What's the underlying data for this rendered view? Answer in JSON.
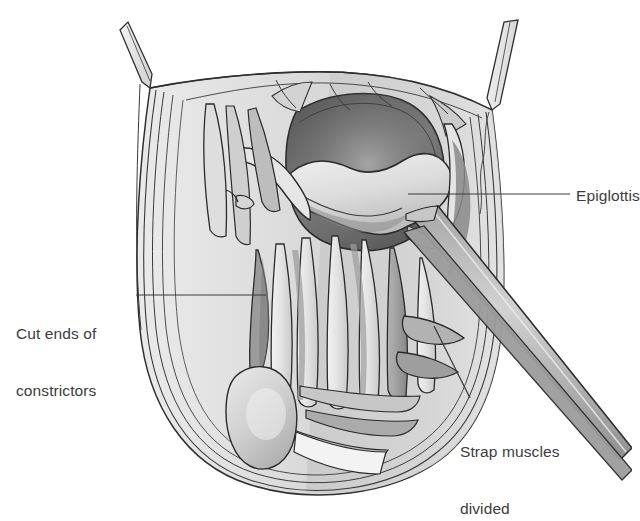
{
  "figure": {
    "kind": "medical-line-illustration",
    "background_color": "#ffffff",
    "ink_color": "#2b2b2b",
    "label_color": "#3c3c3c",
    "leader_color": "#3a3a3a"
  },
  "labels": [
    {
      "id": "epiglottis",
      "text": "Epiglottis",
      "lines": [
        "Epiglottis"
      ],
      "leader": {
        "from_x": 408,
        "from_y": 194,
        "to_x": 570,
        "to_y": 194,
        "style": "horizontal"
      }
    },
    {
      "id": "constrictors",
      "text": "Cut ends of constrictors",
      "lines": [
        "Cut ends of",
        "constrictors"
      ],
      "leader": {
        "from_x": 136,
        "from_y": 295,
        "to_x": 266,
        "to_y": 295,
        "style": "horizontal"
      }
    },
    {
      "id": "strap-muscles",
      "text": "Strap muscles divided",
      "lines": [
        "Strap muscles",
        "divided"
      ],
      "leader": {
        "from_x": 470,
        "from_y": 398,
        "to_x": 434,
        "to_y": 326,
        "style": "diagonal"
      }
    }
  ],
  "anatomy": {
    "specimen_outline": "U-shaped pharyngeal specimen opened anteriorly",
    "structures": [
      {
        "name": "pharyngeal-lumen",
        "tone": "#6e6e6e",
        "note": "dark oval opening at upper centre"
      },
      {
        "name": "epiglottis-flap",
        "tone": "#d8d8d8",
        "note": "pale wavy flap across the lumen"
      },
      {
        "name": "strap-muscles",
        "tone": "#cfcfcf",
        "note": "vertical pale muscle bands"
      },
      {
        "name": "constrictor-muscle-edges",
        "tone": "#9a9a9a",
        "note": "cut muscle margins"
      },
      {
        "name": "retracted-skin-flaps",
        "tone": "#e4e4e4",
        "note": "two narrow strips at the top corners"
      },
      {
        "name": "surgical-retractor",
        "tone": "#b9b9b9",
        "note": "long blade running to the lower right"
      }
    ]
  },
  "watermark": {
    "visible": true,
    "legible": false,
    "text": "",
    "color": "#e9e9ea"
  }
}
